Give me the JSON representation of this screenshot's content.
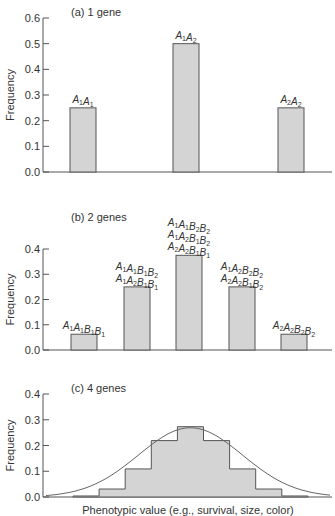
{
  "chart_data": [
    {
      "type": "bar",
      "title": "(a) 1 gene",
      "xlabel": "",
      "ylabel": "Frequency",
      "ylim": [
        0,
        0.6
      ],
      "yticks": [
        "0.0",
        "0.1",
        "0.2",
        "0.3",
        "0.4",
        "0.5",
        "0.6"
      ],
      "grid": false,
      "categories": [
        "A1A1",
        "A1A2",
        "A2A2"
      ],
      "labels": [
        [
          "A1A1"
        ],
        [
          "A1A2"
        ],
        [
          "A2A2"
        ]
      ],
      "values": [
        0.25,
        0.5,
        0.25
      ]
    },
    {
      "type": "bar",
      "title": "(b) 2 genes",
      "xlabel": "",
      "ylabel": "Frequency",
      "ylim": [
        0,
        0.4
      ],
      "yticks": [
        "0.0",
        "0.1",
        "0.2",
        "0.3",
        "0.4"
      ],
      "grid": false,
      "categories": [
        "A1A1B1B1",
        "A1A1B1B2 / A1A2B1B1",
        "A1A1B2B2 / A1A2B1B2 / A2A2B1B1",
        "A1A2B2B2 / A2A2B1B2",
        "A2A2B2B2"
      ],
      "labels": [
        [
          "A1A1B1B1"
        ],
        [
          "A1A1B1B2",
          "A1A2B1B1"
        ],
        [
          "A1A1B2B2",
          "A1A2B1B2",
          "A2A2B1B1"
        ],
        [
          "A1A2B2B2",
          "A2A2B1B2"
        ],
        [
          "A2A2B2B2"
        ]
      ],
      "values": [
        0.0625,
        0.25,
        0.375,
        0.25,
        0.0625
      ]
    },
    {
      "type": "bar",
      "subtype": "step-histogram-with-normal-curve",
      "title": "(c) 4 genes",
      "xlabel": "Phenotypic value (e.g., survival, size, color)",
      "ylabel": "Frequency",
      "ylim": [
        0,
        0.4
      ],
      "yticks": [
        "0.0",
        "0.1",
        "0.2",
        "0.3",
        "0.4"
      ],
      "grid": false,
      "categories": [
        "0",
        "1",
        "2",
        "3",
        "4",
        "5",
        "6",
        "7",
        "8"
      ],
      "values": [
        0.004,
        0.031,
        0.109,
        0.219,
        0.273,
        0.219,
        0.109,
        0.031,
        0.004
      ],
      "overlay": "normal curve fitted to histogram, peak ~0.27"
    }
  ]
}
